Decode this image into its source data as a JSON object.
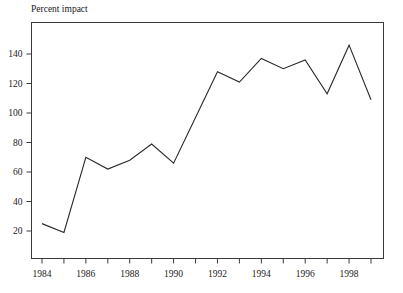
{
  "figure": {
    "top_partial_text": "",
    "y_axis_title": "Percent impact"
  },
  "chart_data": {
    "type": "line",
    "title": "",
    "subtitle": "",
    "xlabel": "",
    "ylabel": "Percent impact",
    "x": [
      1984,
      1985,
      1986,
      1987,
      1988,
      1989,
      1990,
      1991,
      1992,
      1993,
      1994,
      1995,
      1996,
      1997,
      1998,
      1999
    ],
    "values": [
      25,
      19,
      70,
      62,
      68,
      79,
      66,
      97,
      128,
      121,
      137,
      130,
      136,
      113,
      146,
      109
    ],
    "series": [
      {
        "name": "Percent impact",
        "values": [
          25,
          19,
          70,
          62,
          68,
          79,
          66,
          97,
          128,
          121,
          137,
          130,
          136,
          113,
          146,
          109
        ]
      }
    ],
    "xlim": [
      1983.5,
      1999.5
    ],
    "ylim": [
      0,
      156
    ],
    "yticks": [
      20,
      40,
      60,
      80,
      100,
      120,
      140
    ],
    "ytick_labels": [
      "20",
      "40",
      "60",
      "80",
      "100",
      "120",
      "140"
    ],
    "xticks": [
      1984,
      1985,
      1986,
      1987,
      1988,
      1989,
      1990,
      1991,
      1992,
      1993,
      1994,
      1995,
      1996,
      1997,
      1998,
      1999
    ],
    "xtick_labels_shown": [
      "1984",
      "1986",
      "1988",
      "1990",
      "1992",
      "1994",
      "1996",
      "1998"
    ],
    "xtick_labeled_years": [
      1984,
      1986,
      1988,
      1990,
      1992,
      1994,
      1996,
      1998
    ],
    "grid": false,
    "legend": "none",
    "line_color": "#2a2a2a",
    "axis_color": "#3a3a3a",
    "background_color": "#ffffff",
    "markers": false
  }
}
